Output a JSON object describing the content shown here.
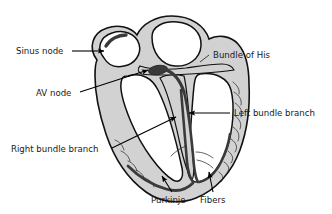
{
  "figure": {
    "background_color": "#ffffff",
    "wall_color": "#d2d2d2",
    "chamber_color": "#ffffff",
    "outline_color": "#111111",
    "conduction_color": "#3a3a3a",
    "label_color": "#1a1a1a"
  },
  "labels": {
    "sinus_node": "Sinus node",
    "av_node": "AV node",
    "bundle_of_his": "Bundle of His",
    "left_bundle_branch": "Left bundle branch",
    "right_bundle_branch": "Right bundle branch",
    "purkinje": "Purkinje",
    "fibers": "Fibers"
  }
}
